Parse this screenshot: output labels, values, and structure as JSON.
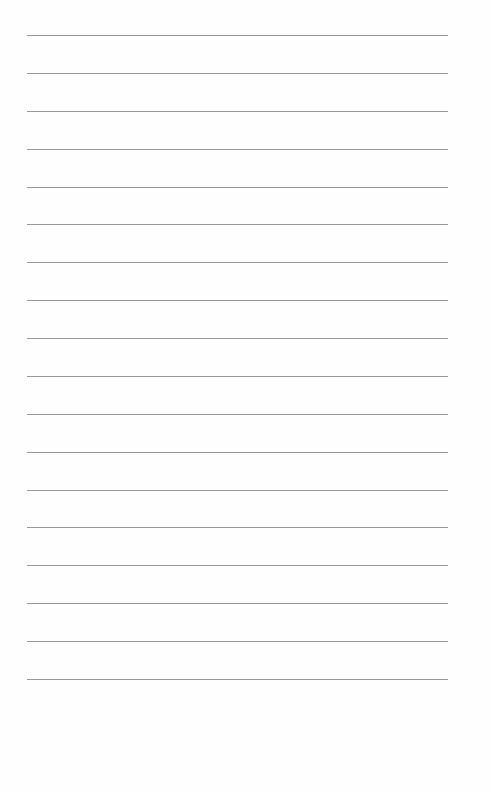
{
  "page": {
    "type": "lined-paper",
    "line_count": 18,
    "line_color": "#9a9a9a",
    "background": "#fefefe",
    "first_line_y": 35,
    "last_line_y": 679,
    "line_left": 27,
    "line_width": 421
  }
}
